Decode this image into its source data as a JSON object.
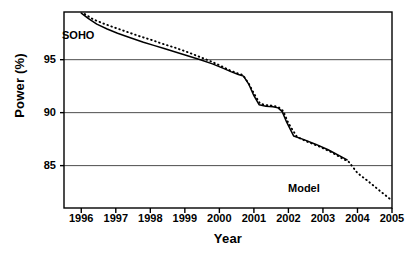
{
  "chart_data": {
    "type": "line",
    "title": "",
    "xlabel": "Year",
    "ylabel": "Power (%)",
    "xlim": [
      1995.5,
      2005.0
    ],
    "ylim": [
      81.0,
      99.5
    ],
    "grid": true,
    "grid_axis": "y",
    "legend_position": "inline-annotations",
    "xticks": [
      "1996",
      "1997",
      "1998",
      "1999",
      "2000",
      "2001",
      "2002",
      "2003",
      "2004",
      "2005"
    ],
    "xtick_values": [
      1996,
      1997,
      1998,
      1999,
      2000,
      2001,
      2002,
      2003,
      2004,
      2005
    ],
    "yticks": [
      "85",
      "90",
      "95"
    ],
    "ytick_values": [
      85,
      90,
      95
    ],
    "series": [
      {
        "name": "SOHO",
        "style": "solid",
        "color": "#000000",
        "label_text": "SOHO",
        "x": [
          1996.0,
          1996.2,
          1996.45,
          1996.75,
          1997.05,
          1997.4,
          1997.8,
          1998.1,
          1998.4,
          1998.75,
          1999.1,
          1999.45,
          1999.8,
          2000.1,
          2000.35,
          2000.55,
          2000.7,
          2000.85,
          2001.0,
          2001.15,
          2001.35,
          2001.55,
          2001.7,
          2001.82,
          2001.95,
          2002.15,
          2002.45,
          2002.8,
          2003.15,
          2003.5,
          2003.7
        ],
        "y": [
          99.4,
          98.9,
          98.35,
          97.9,
          97.5,
          97.1,
          96.65,
          96.35,
          96.05,
          95.7,
          95.35,
          95.0,
          94.6,
          94.2,
          93.85,
          93.6,
          93.45,
          92.7,
          91.6,
          90.75,
          90.6,
          90.55,
          90.45,
          90.1,
          89.1,
          87.8,
          87.45,
          87.0,
          86.5,
          85.9,
          85.55
        ]
      },
      {
        "name": "Model",
        "style": "dotted",
        "color": "#000000",
        "label_text": "Model",
        "x": [
          1996.1,
          1996.35,
          1996.65,
          1996.95,
          1997.3,
          1997.7,
          1998.05,
          1998.35,
          1998.7,
          1999.05,
          1999.4,
          1999.75,
          2000.05,
          2000.3,
          2000.5,
          2000.68,
          2000.85,
          2001.02,
          2001.18,
          2001.38,
          2001.58,
          2001.72,
          2001.85,
          2002.0,
          2002.25,
          2002.55,
          2002.9,
          2003.25,
          2003.55,
          2003.75,
          2004.0,
          2004.3,
          2004.6,
          2004.85,
          2005.0
        ],
        "y": [
          99.3,
          98.8,
          98.4,
          98.05,
          97.65,
          97.2,
          96.85,
          96.5,
          96.15,
          95.75,
          95.3,
          94.85,
          94.4,
          94.0,
          93.75,
          93.55,
          92.75,
          91.7,
          90.85,
          90.7,
          90.65,
          90.5,
          90.15,
          89.0,
          87.7,
          87.25,
          86.8,
          86.25,
          85.7,
          85.35,
          84.3,
          83.55,
          82.75,
          82.1,
          81.7
        ]
      }
    ]
  },
  "axes": {
    "x_label": "Year",
    "y_label": "Power (%)"
  }
}
